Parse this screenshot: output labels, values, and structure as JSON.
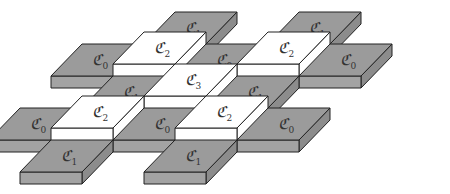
{
  "diagram": {
    "colors": {
      "gray_top": "#9b9b9b",
      "gray_front": "#a3a3a3",
      "gray_side": "#8c8c8c",
      "white_top": "#ffffff",
      "white_front": "#ffffff",
      "white_side": "#ffffff",
      "edge": "#222222"
    },
    "label_symbol": "ℭ",
    "tiles": [
      {
        "row": 0,
        "col": 1,
        "label": "K",
        "sub": "1",
        "kind": "gray"
      },
      {
        "row": 0,
        "col": 3,
        "label": "K",
        "sub": "1",
        "kind": "gray"
      },
      {
        "row": 1,
        "col": 0,
        "label": "K",
        "sub": "0",
        "kind": "gray"
      },
      {
        "row": 1,
        "col": 1,
        "label": "K",
        "sub": "2",
        "kind": "white"
      },
      {
        "row": 1,
        "col": 2,
        "label": "K",
        "sub": "0",
        "kind": "gray"
      },
      {
        "row": 1,
        "col": 3,
        "label": "K",
        "sub": "2",
        "kind": "white"
      },
      {
        "row": 1,
        "col": 4,
        "label": "K",
        "sub": "0",
        "kind": "gray"
      },
      {
        "row": 2,
        "col": 1,
        "label": "K",
        "sub": "1",
        "kind": "gray"
      },
      {
        "row": 2,
        "col": 2,
        "label": "K",
        "sub": "3",
        "kind": "white"
      },
      {
        "row": 2,
        "col": 3,
        "label": "K",
        "sub": "1",
        "kind": "gray"
      },
      {
        "row": 3,
        "col": 0,
        "label": "K",
        "sub": "0",
        "kind": "gray"
      },
      {
        "row": 3,
        "col": 1,
        "label": "K",
        "sub": "2",
        "kind": "white"
      },
      {
        "row": 3,
        "col": 2,
        "label": "K",
        "sub": "0",
        "kind": "gray"
      },
      {
        "row": 3,
        "col": 3,
        "label": "K",
        "sub": "2",
        "kind": "white"
      },
      {
        "row": 3,
        "col": 4,
        "label": "K",
        "sub": "0",
        "kind": "gray"
      },
      {
        "row": 4,
        "col": 1,
        "label": "K",
        "sub": "1",
        "kind": "gray"
      },
      {
        "row": 4,
        "col": 3,
        "label": "K",
        "sub": "1",
        "kind": "gray"
      }
    ]
  }
}
